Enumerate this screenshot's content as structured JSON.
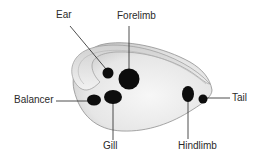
{
  "diagram": {
    "colors": {
      "background": "#ffffff",
      "body_fill": "#ececec",
      "body_edge": "#8a8a8a",
      "spot": "#0d0d0d",
      "leader": "#222222",
      "text": "#2a2a2a"
    },
    "labels": [
      {
        "id": "ear",
        "text": "Ear",
        "target": "ear-spot"
      },
      {
        "id": "forelimb",
        "text": "Forelimb",
        "target": "forelimb-spot"
      },
      {
        "id": "balancer",
        "text": "Balancer",
        "target": "balancer-spot"
      },
      {
        "id": "gill",
        "text": "Gill",
        "target": "gill-spot"
      },
      {
        "id": "hindlimb",
        "text": "Hindlimb",
        "target": "hindlimb-spot"
      },
      {
        "id": "tail",
        "text": "Tail",
        "target": "tail-spot"
      }
    ]
  }
}
